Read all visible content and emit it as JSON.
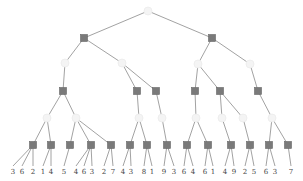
{
  "diagram": {
    "type": "expectimax-tree",
    "colors": {
      "edge": "#8a8a8a",
      "max_node": "#7a7a7a",
      "chance_node": "#f4f4f4",
      "leaf_text": "#444444"
    },
    "nodes": [
      {
        "id": "r",
        "kind": "chance",
        "x": 148,
        "y": 11
      },
      {
        "id": "a",
        "kind": "max",
        "x": 84,
        "y": 38,
        "parent": "r"
      },
      {
        "id": "b",
        "kind": "max",
        "x": 212,
        "y": 38,
        "parent": "r"
      },
      {
        "id": "a1",
        "kind": "chance",
        "x": 65,
        "y": 63,
        "parent": "a"
      },
      {
        "id": "a2",
        "kind": "chance",
        "x": 122,
        "y": 63,
        "parent": "a"
      },
      {
        "id": "b1",
        "kind": "chance",
        "x": 198,
        "y": 64,
        "parent": "b"
      },
      {
        "id": "b2",
        "kind": "chance",
        "x": 250,
        "y": 64,
        "parent": "b"
      },
      {
        "id": "m1",
        "kind": "max",
        "x": 63,
        "y": 91,
        "parent": "a1"
      },
      {
        "id": "m2",
        "kind": "max",
        "x": 137,
        "y": 91,
        "parent": "a2"
      },
      {
        "id": "m3",
        "kind": "max",
        "x": 156,
        "y": 91,
        "parent": "a2"
      },
      {
        "id": "m4",
        "kind": "max",
        "x": 195,
        "y": 91,
        "parent": "b1"
      },
      {
        "id": "m5",
        "kind": "max",
        "x": 220,
        "y": 91,
        "parent": "b1"
      },
      {
        "id": "m6",
        "kind": "max",
        "x": 258,
        "y": 91,
        "parent": "b2"
      },
      {
        "id": "c1",
        "kind": "chance",
        "x": 47,
        "y": 118,
        "parent": "m1"
      },
      {
        "id": "c2",
        "kind": "chance",
        "x": 76,
        "y": 118,
        "parent": "m1"
      },
      {
        "id": "c3",
        "kind": "chance",
        "x": 139,
        "y": 118,
        "parent": "m2"
      },
      {
        "id": "c4",
        "kind": "chance",
        "x": 162,
        "y": 118,
        "parent": "m3"
      },
      {
        "id": "c5",
        "kind": "chance",
        "x": 196,
        "y": 118,
        "parent": "m4"
      },
      {
        "id": "c6",
        "kind": "chance",
        "x": 222,
        "y": 118,
        "parent": "m5"
      },
      {
        "id": "c7",
        "kind": "chance",
        "x": 243,
        "y": 118,
        "parent": "m5"
      },
      {
        "id": "c8",
        "kind": "chance",
        "x": 272,
        "y": 118,
        "parent": "m6"
      },
      {
        "id": "n1",
        "kind": "max",
        "x": 33,
        "y": 145,
        "parent": "c1"
      },
      {
        "id": "n2",
        "kind": "max",
        "x": 51,
        "y": 145,
        "parent": "c1"
      },
      {
        "id": "n3",
        "kind": "max",
        "x": 70,
        "y": 145,
        "parent": "c2"
      },
      {
        "id": "n4",
        "kind": "max",
        "x": 91,
        "y": 145,
        "parent": "c2"
      },
      {
        "id": "n5",
        "kind": "max",
        "x": 111,
        "y": 145,
        "parent": "c2"
      },
      {
        "id": "n6",
        "kind": "max",
        "x": 130,
        "y": 145,
        "parent": "c3"
      },
      {
        "id": "n7",
        "kind": "max",
        "x": 147,
        "y": 145,
        "parent": "c3"
      },
      {
        "id": "n8",
        "kind": "max",
        "x": 167,
        "y": 145,
        "parent": "c4"
      },
      {
        "id": "n9",
        "kind": "max",
        "x": 187,
        "y": 145,
        "parent": "c5"
      },
      {
        "id": "n10",
        "kind": "max",
        "x": 208,
        "y": 145,
        "parent": "c5"
      },
      {
        "id": "n11",
        "kind": "max",
        "x": 231,
        "y": 145,
        "parent": "c6"
      },
      {
        "id": "n12",
        "kind": "max",
        "x": 250,
        "y": 145,
        "parent": "c7"
      },
      {
        "id": "n13",
        "kind": "max",
        "x": 269,
        "y": 145,
        "parent": "c8"
      },
      {
        "id": "n14",
        "kind": "max",
        "x": 288,
        "y": 145,
        "parent": "c8"
      }
    ],
    "leaves": [
      {
        "value": "3",
        "x": 13,
        "parent": "n1"
      },
      {
        "value": "6",
        "x": 22,
        "parent": "n1"
      },
      {
        "value": "2",
        "x": 33,
        "parent": "n1"
      },
      {
        "value": "1",
        "x": 43,
        "parent": "n2"
      },
      {
        "value": "4",
        "x": 51,
        "parent": "n2"
      },
      {
        "value": "5",
        "x": 64,
        "parent": "n3"
      },
      {
        "value": "4",
        "x": 76,
        "parent": "n4"
      },
      {
        "value": "6",
        "x": 84,
        "parent": "n4"
      },
      {
        "value": "3",
        "x": 92,
        "parent": "n4"
      },
      {
        "value": "2",
        "x": 104,
        "parent": "n5"
      },
      {
        "value": "7",
        "x": 113,
        "parent": "n5"
      },
      {
        "value": "4",
        "x": 123,
        "parent": "n6"
      },
      {
        "value": "3",
        "x": 131,
        "parent": "n6"
      },
      {
        "value": "8",
        "x": 144,
        "parent": "n7"
      },
      {
        "value": "1",
        "x": 152,
        "parent": "n7"
      },
      {
        "value": "9",
        "x": 164,
        "parent": "n8"
      },
      {
        "value": "3",
        "x": 174,
        "parent": "n8"
      },
      {
        "value": "6",
        "x": 184,
        "parent": "n9"
      },
      {
        "value": "4",
        "x": 193,
        "parent": "n9"
      },
      {
        "value": "6",
        "x": 205,
        "parent": "n10"
      },
      {
        "value": "1",
        "x": 213,
        "parent": "n10"
      },
      {
        "value": "4",
        "x": 225,
        "parent": "n11"
      },
      {
        "value": "9",
        "x": 234,
        "parent": "n11"
      },
      {
        "value": "2",
        "x": 245,
        "parent": "n12"
      },
      {
        "value": "5",
        "x": 254,
        "parent": "n12"
      },
      {
        "value": "6",
        "x": 266,
        "parent": "n13"
      },
      {
        "value": "3",
        "x": 275,
        "parent": "n13"
      },
      {
        "value": "7",
        "x": 291,
        "parent": "n14"
      }
    ],
    "leaf_y": 172
  }
}
